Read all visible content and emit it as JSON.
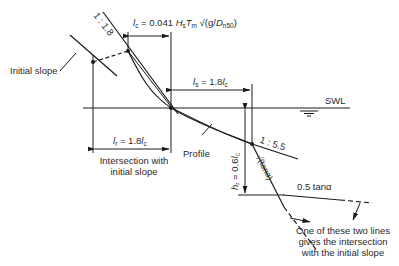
{
  "diagram": {
    "labels": {
      "slope_upper": "1 : 1.8",
      "lc_formula": {
        "var": "l",
        "sub": "c",
        "text": " = 0.041 ",
        "H": "H",
        "Hsub": "s",
        "T": "T",
        "Tsub": "m",
        "rest": " √(g/",
        "D": "D",
        "Dsub": "n50",
        "close": ")"
      },
      "initial_slope": "Initial slope",
      "ls_label": {
        "var": "l",
        "sub": "s",
        "text": " = 1.8",
        "var2": "l",
        "sub2": "c"
      },
      "swl": "SWL",
      "lr_label": {
        "var": "l",
        "sub": "r",
        "text": " = 1.8",
        "var2": "l",
        "sub2": "c"
      },
      "intersection_note_line1": "Intersection with",
      "intersection_note_line2": "initial slope",
      "profile": "Profile",
      "slope_lower": "1 : 5.5",
      "hr_label": {
        "var": "h",
        "sub": "r",
        "text": " = 0.6",
        "var2": "l",
        "sub2": "c"
      },
      "sqrt_tan": "√(tanα)",
      "half_tan": "0.5 tanα",
      "footnote_line1": "One of these two lines",
      "footnote_line2": "gives the intersection",
      "footnote_line3": "with the initial slope"
    },
    "colors": {
      "line": "#1a1a1a",
      "text": "#2a2a2a",
      "background": "#ffffff"
    }
  }
}
